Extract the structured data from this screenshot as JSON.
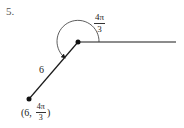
{
  "problem": {
    "number": "5."
  },
  "diagram": {
    "angle": {
      "numerator": "4π",
      "denominator": "3"
    },
    "radius_label": "6",
    "point": {
      "open": "(",
      "r": "6",
      "sep": ",",
      "theta_numerator": "4π",
      "theta_denominator": "3",
      "close": ")"
    },
    "colors": {
      "line": "#1a1a1a",
      "text": "#222222"
    }
  }
}
